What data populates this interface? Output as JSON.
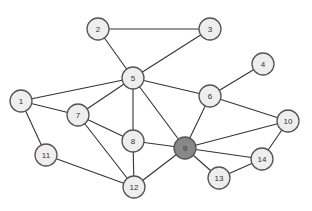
{
  "graph": {
    "node_fill": "#eeeeee",
    "highlight_fill": "#888888",
    "node_radius": 11,
    "nodes": [
      {
        "id": "1",
        "label": "1",
        "x": 21,
        "y": 101
      },
      {
        "id": "2",
        "label": "2",
        "x": 98,
        "y": 29
      },
      {
        "id": "3",
        "label": "3",
        "x": 210,
        "y": 29
      },
      {
        "id": "4",
        "label": "4",
        "x": 263,
        "y": 64
      },
      {
        "id": "5",
        "label": "5",
        "x": 133,
        "y": 78
      },
      {
        "id": "6",
        "label": "6",
        "x": 210,
        "y": 96
      },
      {
        "id": "7",
        "label": "7",
        "x": 78,
        "y": 115
      },
      {
        "id": "8",
        "label": "8",
        "x": 133,
        "y": 141
      },
      {
        "id": "9",
        "label": "9",
        "x": 185,
        "y": 148,
        "highlighted": true
      },
      {
        "id": "10",
        "label": "10",
        "x": 288,
        "y": 121
      },
      {
        "id": "11",
        "label": "11",
        "x": 46,
        "y": 155
      },
      {
        "id": "12",
        "label": "12",
        "x": 134,
        "y": 187
      },
      {
        "id": "13",
        "label": "13",
        "x": 219,
        "y": 178
      },
      {
        "id": "14",
        "label": "14",
        "x": 262,
        "y": 159
      }
    ],
    "edges": [
      [
        "1",
        "5"
      ],
      [
        "1",
        "7"
      ],
      [
        "1",
        "11"
      ],
      [
        "2",
        "3"
      ],
      [
        "2",
        "5"
      ],
      [
        "3",
        "5"
      ],
      [
        "4",
        "6"
      ],
      [
        "5",
        "6"
      ],
      [
        "5",
        "7"
      ],
      [
        "5",
        "8"
      ],
      [
        "5",
        "9"
      ],
      [
        "6",
        "9"
      ],
      [
        "6",
        "10"
      ],
      [
        "7",
        "8"
      ],
      [
        "7",
        "12"
      ],
      [
        "8",
        "9"
      ],
      [
        "8",
        "12"
      ],
      [
        "9",
        "10"
      ],
      [
        "9",
        "12"
      ],
      [
        "9",
        "13"
      ],
      [
        "9",
        "14"
      ],
      [
        "10",
        "14"
      ],
      [
        "11",
        "12"
      ],
      [
        "13",
        "14"
      ]
    ]
  }
}
